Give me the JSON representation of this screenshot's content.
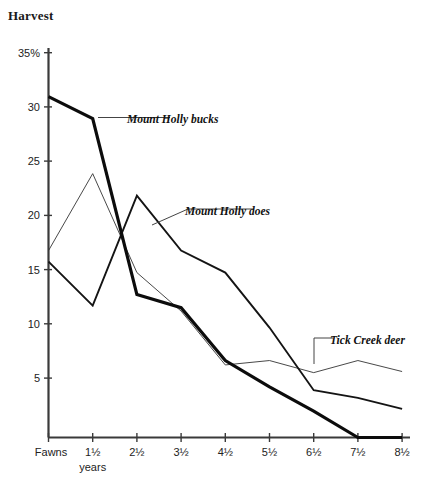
{
  "chart_data": {
    "type": "line",
    "title": "Harvest",
    "xlabel": "years",
    "ylabel": "",
    "ylim": [
      0,
      35
    ],
    "grid": false,
    "legend_position": "inline-annotations",
    "categories": [
      "Fawns",
      "1½",
      "2½",
      "3½",
      "4½",
      "5½",
      "6½",
      "7½",
      "8½"
    ],
    "y_ticks": [
      "5",
      "10",
      "15",
      "20",
      "25",
      "30",
      "35%"
    ],
    "y_tick_values": [
      5,
      10,
      15,
      20,
      25,
      30,
      35
    ],
    "series": [
      {
        "name": "Mount Holly bucks",
        "style": "thick",
        "values": [
          31.0,
          29.0,
          13.0,
          11.8,
          7.0,
          4.6,
          2.4,
          0.0,
          0.0
        ]
      },
      {
        "name": "Mount Holly does",
        "style": "medium",
        "values": [
          16.0,
          12.0,
          22.0,
          17.0,
          15.0,
          10.0,
          4.3,
          3.6,
          2.6
        ]
      },
      {
        "name": "Tick Creek deer",
        "style": "thin",
        "values": [
          17.0,
          24.0,
          15.0,
          11.5,
          6.6,
          7.0,
          5.9,
          7.0,
          6.0
        ]
      }
    ],
    "annotations": [
      {
        "text": "Mount Holly bucks",
        "target_series": "Mount Holly bucks",
        "target_x": "1½"
      },
      {
        "text": "Mount Holly does",
        "target_series": "Mount Holly does",
        "target_x": "2½"
      },
      {
        "text": "Tick Creek deer",
        "target_series": "Tick Creek deer",
        "target_x": "6½"
      }
    ]
  },
  "labels": {
    "title": "Harvest",
    "x_axis_sub": "years",
    "series_bucks": "Mount Holly bucks",
    "series_does": "Mount Holly does",
    "series_tick": "Tick Creek deer",
    "y0": "5",
    "y1": "10",
    "y2": "15",
    "y3": "20",
    "y4": "25",
    "y5": "30",
    "y6": "35%",
    "x0": "Fawns",
    "x1": "1½",
    "x2": "2½",
    "x3": "3½",
    "x4": "4½",
    "x5": "5½",
    "x6": "6½",
    "x7": "7½",
    "x8": "8½"
  }
}
